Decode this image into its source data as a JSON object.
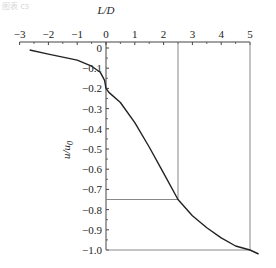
{
  "header": {
    "caption": "图表 cs"
  },
  "chart_data": {
    "type": "line",
    "title": "",
    "xlabel": "L/D",
    "ylabel": "u/u0",
    "xlim": [
      -3,
      5.3
    ],
    "ylim": [
      -1.0,
      0
    ],
    "x_ticks": [
      -3,
      -2,
      -1,
      0,
      1,
      2,
      3,
      4,
      5
    ],
    "y_ticks": [
      0,
      -0.1,
      -0.2,
      -0.3,
      -0.4,
      -0.5,
      -0.6,
      -0.7,
      -0.8,
      -0.9,
      -1.0
    ],
    "x_tick_labels": [
      "−3",
      "−2",
      "−1",
      "0",
      "1",
      "2",
      "3",
      "4",
      "5"
    ],
    "y_tick_labels": [
      "0",
      "−0.1",
      "−0.2",
      "−0.3",
      "−0.4",
      "−0.5",
      "−0.6",
      "−0.7",
      "−0.8",
      "−0.9",
      "−1.0"
    ],
    "x_axis_position": "top",
    "grid": false,
    "series": [
      {
        "name": "u/u0 vs L/D",
        "x": [
          -2.65,
          -2.0,
          -1.5,
          -1.0,
          -0.5,
          -0.2,
          -0.05,
          0.0,
          0.1,
          0.5,
          1.0,
          1.5,
          2.0,
          2.5,
          3.0,
          3.5,
          4.0,
          4.5,
          5.0,
          5.3
        ],
        "y": [
          -0.01,
          -0.03,
          -0.045,
          -0.06,
          -0.09,
          -0.12,
          -0.16,
          -0.2,
          -0.22,
          -0.27,
          -0.37,
          -0.49,
          -0.62,
          -0.75,
          -0.83,
          -0.89,
          -0.94,
          -0.98,
          -1.0,
          -1.02
        ]
      }
    ],
    "annotations": [
      {
        "type": "reference-box",
        "x": 2.5,
        "y": -0.75,
        "description": "vertical line at L/D=2.5 and horizontal line at u/u0=-0.75"
      },
      {
        "type": "reference-box",
        "x": 5,
        "y": -1.0,
        "description": "vertical line at L/D=5 and horizontal line at u/u0=-1.0"
      }
    ]
  },
  "colors": {
    "curve": "#222222",
    "reference_lines": "#888888",
    "axis": "#444444"
  }
}
